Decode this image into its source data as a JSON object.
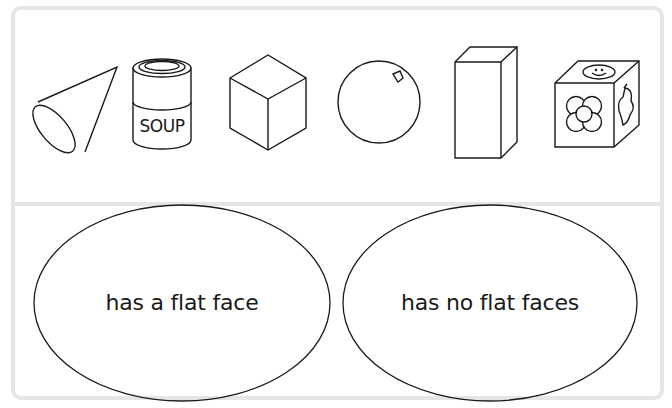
{
  "worksheet": {
    "shapes_panel": {
      "shapes": [
        {
          "name": "cone",
          "icon": "cone-icon"
        },
        {
          "name": "soup can (cylinder)",
          "icon": "cylinder-can-icon",
          "label": "SOUP"
        },
        {
          "name": "cube",
          "icon": "cube-icon"
        },
        {
          "name": "sphere",
          "icon": "sphere-icon"
        },
        {
          "name": "cuboid",
          "icon": "cuboid-icon"
        },
        {
          "name": "toy block with pictures",
          "icon": "picture-cube-icon"
        }
      ]
    },
    "sorting_panel": {
      "categories": [
        {
          "label": "has a flat face"
        },
        {
          "label": "has no flat faces"
        }
      ]
    }
  },
  "colors": {
    "line": "#1a1a1a",
    "panel_border": "#e6e6e6",
    "background": "#ffffff"
  }
}
